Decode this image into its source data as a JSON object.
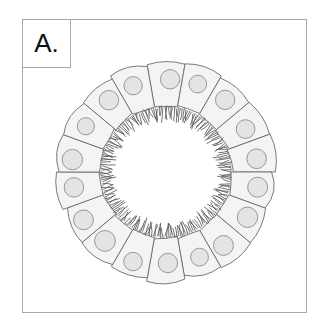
{
  "figure": {
    "domain_type": "biology-diagram",
    "background_color": "#ffffff",
    "frame": {
      "name": "panel-frame",
      "x": 22,
      "y": 19,
      "width": 285,
      "height": 294,
      "stroke_color": "#a9a9a9",
      "stroke_width": 1,
      "fill_color": "#ffffff"
    },
    "label": {
      "text": "A.",
      "box": {
        "x": 22,
        "y": 19,
        "width": 49,
        "height": 49
      },
      "border_color": "#a9a9a9",
      "text_color": "#111111",
      "font_size_px": 26
    }
  },
  "diagram": {
    "type": "radial-cell-ring",
    "center": {
      "x": 166,
      "y": 172
    },
    "cell_count": 18,
    "outer_radius": 108,
    "inner_radius": 66,
    "lumen_radius": 62,
    "lumen_fill": "#ffffff",
    "cell": {
      "fill_color": "#f4f4f4",
      "stroke_color": "#6b6b6b",
      "stroke_width": 0.9,
      "outer_bulge": 6,
      "shape": "wedge / trapezoid with rounded outer edge"
    },
    "nucleus": {
      "fill_color": "#e4e4e4",
      "stroke_color": "#8d8d8d",
      "stroke_width": 0.9,
      "radius": 9.5,
      "radial_position_fraction": 0.64,
      "count": 18
    },
    "microvilli": {
      "name": "brush-border",
      "stroke_color": "#5a5a5a",
      "stroke_width": 0.85,
      "length": 11,
      "count": 210,
      "base_radius": 65,
      "description": "dense short irregular projections extending inward from the apical cell surface into the lumen"
    }
  }
}
